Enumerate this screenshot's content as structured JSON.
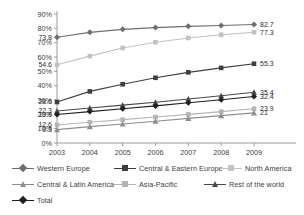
{
  "chart_data": {
    "type": "line",
    "title": "",
    "xlabel": "",
    "ylabel": "",
    "categories": [
      "2003",
      "2004",
      "2005",
      "2006",
      "2007",
      "2008",
      "2009"
    ],
    "ylim": [
      0,
      90
    ],
    "ytick_labels": [
      "0%",
      "10%",
      "20%",
      "30%",
      "40%",
      "50%",
      "60%",
      "70%",
      "80%",
      "90%"
    ],
    "ytick_values": [
      0,
      10,
      20,
      30,
      40,
      50,
      60,
      70,
      80,
      90
    ],
    "grid": false,
    "legend_position": "bottom",
    "series": [
      {
        "name": "Western Europe",
        "color": "#6e6e6e",
        "marker": "diamond",
        "values": [
          73.8,
          77.2,
          79.3,
          80.5,
          81.4,
          82.0,
          82.7
        ],
        "start_label": "73.8",
        "end_label": "82.7"
      },
      {
        "name": "Central & Eastern Europe",
        "color": "#3f3f3f",
        "marker": "square",
        "values": [
          28.6,
          36.0,
          41.0,
          45.5,
          49.3,
          52.4,
          55.3
        ],
        "start_label": "28.6",
        "end_label": "55.3"
      },
      {
        "name": "North America",
        "color": "#c2c2c2",
        "marker": "square",
        "values": [
          54.6,
          60.6,
          66.3,
          70.3,
          73.3,
          75.5,
          77.3
        ],
        "start_label": "54.6",
        "end_label": "77.3"
      },
      {
        "name": "Central & Latin America",
        "color": "#8f8f8f",
        "marker": "triangle",
        "values": [
          9.3,
          11.4,
          13.3,
          15.2,
          17.2,
          19.1,
          21.0
        ],
        "start_label": "9.3",
        "end_label": "21"
      },
      {
        "name": "Asia-Pacific",
        "color": "#b5b5b5",
        "marker": "square",
        "values": [
          12.6,
          14.5,
          16.3,
          18.1,
          20.0,
          21.9,
          23.9
        ],
        "start_label": "12.6",
        "end_label": "23.9"
      },
      {
        "name": "Rest of the world",
        "color": "#4a4a4a",
        "marker": "triangle",
        "values": [
          22.3,
          24.4,
          26.4,
          28.4,
          30.7,
          33.0,
          35.4
        ],
        "start_label": "22.3",
        "end_label": "35.4"
      },
      {
        "name": "Total",
        "color": "#1f1f1f",
        "marker": "diamond",
        "values": [
          19.9,
          21.9,
          23.9,
          25.9,
          28.1,
          30.2,
          32.4
        ],
        "start_label": "19.9",
        "end_label": "32.4"
      }
    ]
  },
  "legend": {
    "rows": [
      [
        "Western Europe",
        "Central & Eastern Europe",
        "North America"
      ],
      [
        "Central & Latin America",
        "Asia-Pacific",
        "Rest of the world"
      ],
      [
        "Total"
      ]
    ]
  },
  "axis": {
    "axis_color": "#9a9a9a"
  }
}
